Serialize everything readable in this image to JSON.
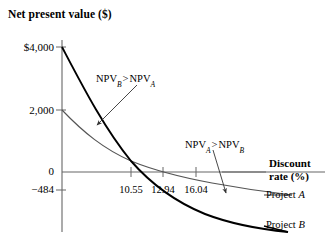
{
  "chart_data": {
    "type": "line",
    "title": "Net present value ($)",
    "xlabel_line1": "Discount",
    "xlabel_line2": "rate (%)",
    "ylabel": "Net present value ($)",
    "grid": false,
    "legend_position": "right-inline",
    "xlim": [
      0,
      26
    ],
    "ylim": [
      -1400,
      4400
    ],
    "yticks": [
      "$4,000",
      "2,000",
      "0",
      "−484"
    ],
    "ytick_values": [
      4000,
      2000,
      0,
      -484
    ],
    "xticks": [
      "10.55",
      "12.94",
      "16.04"
    ],
    "xtick_values": [
      10.55,
      12.94,
      16.04
    ],
    "series": [
      {
        "name": "Project A",
        "label": "Project A",
        "color": "#555555",
        "intercept_y": 2000,
        "irr": 16.04,
        "x": [
          0,
          2,
          4,
          6,
          8,
          10.55,
          12.94,
          16.04,
          19,
          22,
          25
        ],
        "values": [
          2000,
          1660,
          1360,
          1090,
          860,
          600,
          390,
          0,
          -210,
          -420,
          -560
        ]
      },
      {
        "name": "Project B",
        "label": "Project B",
        "color": "#000000",
        "intercept_y": 4000,
        "irr": 12.94,
        "x": [
          0,
          2,
          4,
          6,
          8,
          10.55,
          12.94,
          16.04,
          19,
          22,
          25
        ],
        "values": [
          4000,
          3210,
          2530,
          1940,
          1420,
          600,
          0,
          -700,
          -1130,
          -1460,
          -1700
        ]
      }
    ],
    "crossover_x": 10.55,
    "annotations": [
      {
        "id": "npv-b-gt-a",
        "text": "NPV_B > NPV_A",
        "lead": "NPV",
        "sub1": "B",
        "op": ">",
        "trail": "NPV",
        "sub2": "A",
        "points_to": "Project A curve"
      },
      {
        "id": "npv-a-gt-b",
        "text": "NPV_A > NPV_B",
        "lead": "NPV",
        "sub1": "A",
        "op": ">",
        "trail": "NPV",
        "sub2": "B",
        "points_to": "Project B curve"
      }
    ],
    "colors": {
      "project_a": "#555555",
      "project_b": "#000000",
      "axis": "#666666",
      "text": "#000000"
    }
  }
}
